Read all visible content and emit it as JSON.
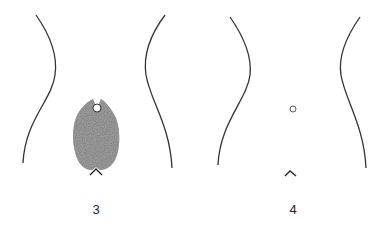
{
  "figures": [
    {
      "label": "3",
      "description": "Torso outline with shaded pubic hair region, navel circle and caret marker"
    },
    {
      "label": "4",
      "description": "Torso outline with navel circle and caret marker, no shading"
    }
  ],
  "colors": {
    "line": "#333333",
    "shade": "#6e6e6e",
    "background": "#ffffff"
  }
}
